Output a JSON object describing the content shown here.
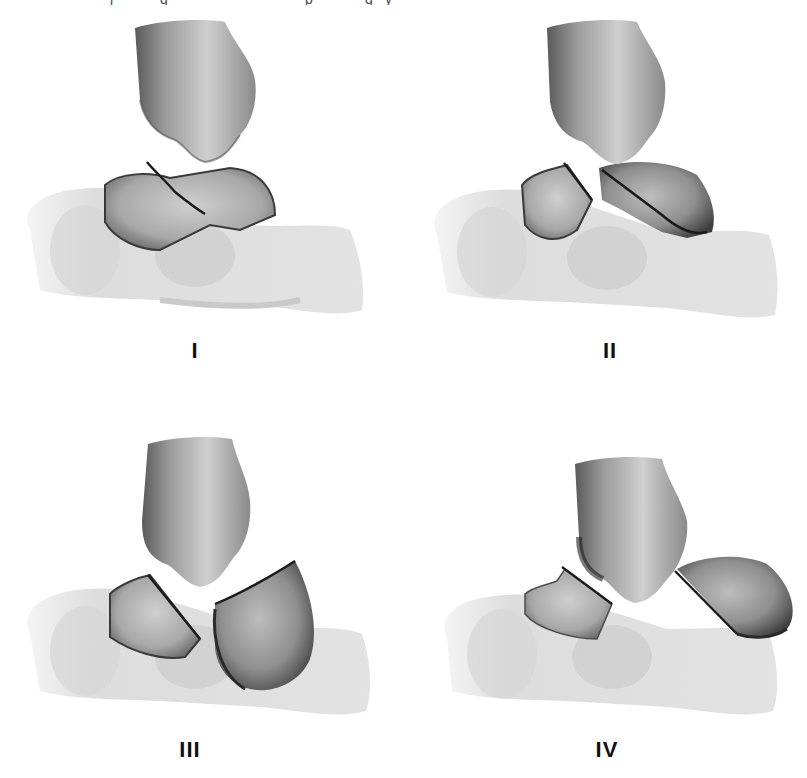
{
  "figure": {
    "top_text_fragment": "(clipped caption text above figure)",
    "panels": [
      {
        "id": "I",
        "label": "I",
        "description": "Undisplaced talar neck fracture"
      },
      {
        "id": "II",
        "label": "II",
        "description": "Talar neck fracture with subtalar subluxation"
      },
      {
        "id": "III",
        "label": "III",
        "description": "Talar neck fracture with subtalar and tibiotalar dislocation"
      },
      {
        "id": "IV",
        "label": "IV",
        "description": "Talar neck fracture with additional talonavicular dislocation"
      }
    ],
    "colors": {
      "bone_light": "#e4e4e4",
      "bone_mid": "#bdbdbd",
      "bone_dark": "#6a6a6a",
      "fracture_line": "#1a1a1a",
      "background": "#ffffff"
    }
  }
}
